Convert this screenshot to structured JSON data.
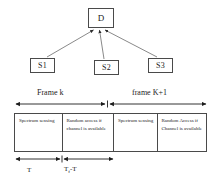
{
  "diagram": {
    "topology": {
      "destination": {
        "label": "D",
        "name": "destination-node"
      },
      "sources": [
        {
          "label": "S1",
          "name": "source-node-s1"
        },
        {
          "label": "S2",
          "name": "source-node-s2"
        },
        {
          "label": "S3",
          "name": "source-node-s3"
        }
      ]
    },
    "frame_structure": {
      "span_labels": [
        {
          "label": "Frame k"
        },
        {
          "label": "frame K+1"
        }
      ],
      "cells": [
        {
          "text": "Spectrum sensing"
        },
        {
          "text": "Random access if channel is available"
        },
        {
          "text": "Spectrum sensing"
        },
        {
          "text": "Random Access if Channel is available"
        }
      ],
      "time_labels": [
        {
          "label": "T"
        },
        {
          "label_prefix": "T",
          "label_sub": "f",
          "label_suffix": "-T"
        }
      ]
    },
    "colors": {
      "stroke": "#4a4a4a",
      "text": "#1c1c1c",
      "background": "#ffffff"
    }
  }
}
